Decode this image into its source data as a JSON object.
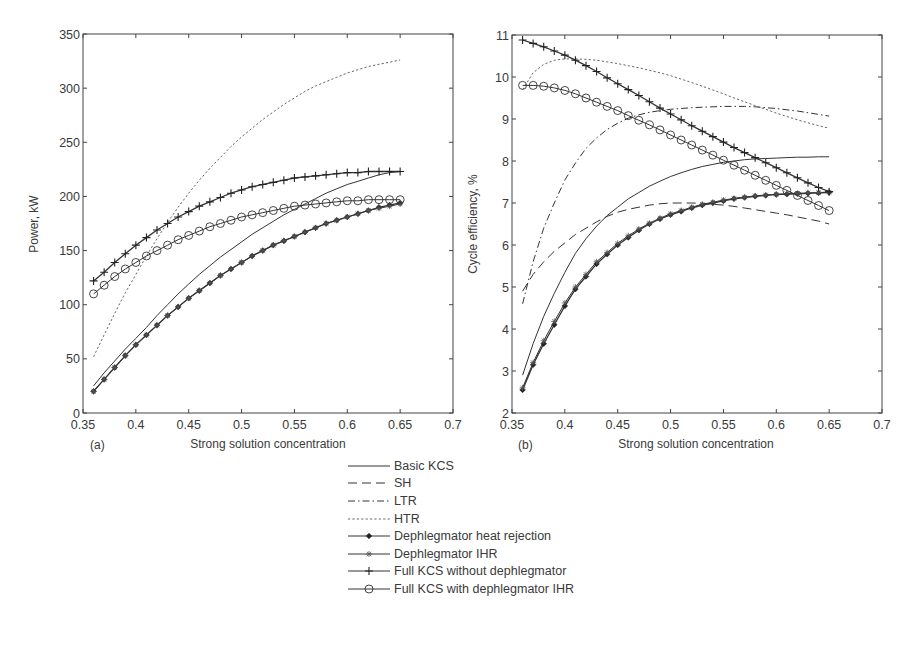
{
  "figure": {
    "panel_a_label": "(a)",
    "panel_b_label": "(b)"
  },
  "legend": {
    "items": [
      {
        "label": "Basic KCS",
        "style": "solid",
        "marker": "none"
      },
      {
        "label": "SH",
        "style": "longdash",
        "marker": "none"
      },
      {
        "label": "LTR",
        "style": "dashdot",
        "marker": "none"
      },
      {
        "label": "HTR",
        "style": "dotted",
        "marker": "none"
      },
      {
        "label": "Dephlegmator heat rejection",
        "style": "solid",
        "marker": "diamond"
      },
      {
        "label": "Dephlegmator IHR",
        "style": "solid",
        "marker": "star"
      },
      {
        "label": "Full KCS without dephlegmator",
        "style": "solid",
        "marker": "plus"
      },
      {
        "label": "Full KCS with dephlegmator IHR",
        "style": "solid",
        "marker": "circle"
      }
    ]
  },
  "chart_data": [
    {
      "type": "line",
      "panel": "(a)",
      "title": "",
      "xlabel": "Strong solution concentration",
      "ylabel": "Power, kW",
      "xlim": [
        0.35,
        0.7
      ],
      "ylim": [
        0,
        350
      ],
      "xticks": [
        "0.35",
        "0.4",
        "0.45",
        "0.5",
        "0.55",
        "0.6",
        "0.65",
        "0.7"
      ],
      "yticks": [
        "0",
        "50",
        "100",
        "150",
        "200",
        "250",
        "300",
        "350"
      ],
      "grid": false,
      "x": [
        0.36,
        0.37,
        0.38,
        0.39,
        0.4,
        0.41,
        0.42,
        0.43,
        0.44,
        0.45,
        0.46,
        0.47,
        0.48,
        0.49,
        0.5,
        0.51,
        0.52,
        0.53,
        0.54,
        0.55,
        0.56,
        0.57,
        0.58,
        0.59,
        0.6,
        0.61,
        0.62,
        0.63,
        0.64,
        0.65
      ],
      "series": [
        {
          "name": "Basic KCS",
          "values": [
            25,
            37,
            48,
            59,
            69,
            79,
            90,
            100,
            110,
            119,
            128,
            136,
            144,
            151,
            158,
            165,
            171,
            177,
            183,
            188,
            193,
            198,
            203,
            207,
            211,
            214,
            217,
            220,
            222,
            223
          ]
        },
        {
          "name": "HTR",
          "values": [
            52,
            72,
            92,
            111,
            128,
            145,
            161,
            176,
            190,
            203,
            215,
            226,
            236,
            246,
            255,
            263,
            271,
            278,
            285,
            291,
            297,
            302,
            306,
            310,
            314,
            317,
            320,
            322,
            324,
            326
          ]
        },
        {
          "name": "Dephlegmator heat rejection",
          "values": [
            20,
            31,
            42,
            53,
            63,
            72,
            81,
            90,
            98,
            106,
            113,
            120,
            127,
            133,
            139,
            145,
            150,
            155,
            159,
            163,
            167,
            171,
            175,
            178,
            181,
            184,
            187,
            190,
            192,
            194
          ]
        },
        {
          "name": "Dephlegmator IHR",
          "values": [
            20,
            31,
            42,
            53,
            63,
            72,
            81,
            90,
            98,
            106,
            113,
            120,
            127,
            133,
            139,
            145,
            150,
            155,
            159,
            163,
            167,
            171,
            175,
            178,
            181,
            184,
            187,
            189,
            191,
            193
          ]
        },
        {
          "name": "Full KCS without dephlegmator",
          "values": [
            122,
            130,
            139,
            147,
            155,
            162,
            169,
            175,
            181,
            186,
            191,
            195,
            199,
            203,
            206,
            209,
            211,
            213,
            215,
            217,
            218,
            219,
            220,
            221,
            222,
            222,
            223,
            223,
            223,
            223
          ]
        },
        {
          "name": "Full KCS with dephlegmator IHR",
          "values": [
            110,
            118,
            126,
            133,
            139,
            145,
            150,
            155,
            160,
            164,
            168,
            172,
            175,
            178,
            181,
            183,
            185,
            187,
            189,
            191,
            192,
            193,
            194,
            195,
            196,
            196,
            197,
            197,
            197,
            197
          ]
        }
      ]
    },
    {
      "type": "line",
      "panel": "(b)",
      "title": "",
      "xlabel": "Strong solution concentration",
      "ylabel": "Cycle efficiency, %",
      "xlim": [
        0.35,
        0.7
      ],
      "ylim": [
        2,
        11
      ],
      "xticks": [
        "0.35",
        "0.4",
        "0.45",
        "0.5",
        "0.55",
        "0.6",
        "0.65",
        "0.7"
      ],
      "yticks": [
        "2",
        "3",
        "4",
        "5",
        "6",
        "7",
        "8",
        "9",
        "10",
        "11"
      ],
      "grid": false,
      "x": [
        0.36,
        0.37,
        0.38,
        0.39,
        0.4,
        0.41,
        0.42,
        0.43,
        0.44,
        0.45,
        0.46,
        0.47,
        0.48,
        0.49,
        0.5,
        0.51,
        0.52,
        0.53,
        0.54,
        0.55,
        0.56,
        0.57,
        0.58,
        0.59,
        0.6,
        0.61,
        0.62,
        0.63,
        0.64,
        0.65
      ],
      "series": [
        {
          "name": "Basic KCS",
          "values": [
            2.9,
            3.65,
            4.3,
            4.85,
            5.35,
            5.8,
            6.15,
            6.45,
            6.7,
            6.9,
            7.1,
            7.25,
            7.4,
            7.52,
            7.63,
            7.72,
            7.8,
            7.87,
            7.92,
            7.97,
            8.0,
            8.03,
            8.05,
            8.06,
            8.07,
            8.08,
            8.09,
            8.09,
            8.1,
            8.1
          ]
        },
        {
          "name": "SH",
          "values": [
            4.9,
            5.3,
            5.6,
            5.85,
            6.05,
            6.25,
            6.4,
            6.55,
            6.68,
            6.78,
            6.85,
            6.9,
            6.95,
            6.98,
            7.0,
            7.0,
            7.0,
            6.99,
            6.97,
            6.95,
            6.92,
            6.88,
            6.84,
            6.8,
            6.76,
            6.72,
            6.67,
            6.62,
            6.57,
            6.5
          ]
        },
        {
          "name": "LTR",
          "values": [
            4.6,
            5.6,
            6.4,
            7.0,
            7.55,
            7.95,
            8.3,
            8.55,
            8.75,
            8.9,
            9.02,
            9.1,
            9.16,
            9.2,
            9.23,
            9.25,
            9.27,
            9.28,
            9.29,
            9.3,
            9.3,
            9.3,
            9.29,
            9.27,
            9.25,
            9.22,
            9.19,
            9.15,
            9.11,
            9.07
          ]
        },
        {
          "name": "HTR",
          "values": [
            9.7,
            10.1,
            10.3,
            10.4,
            10.43,
            10.43,
            10.42,
            10.4,
            10.36,
            10.32,
            10.27,
            10.22,
            10.16,
            10.1,
            10.03,
            9.95,
            9.87,
            9.78,
            9.69,
            9.6,
            9.5,
            9.41,
            9.32,
            9.23,
            9.14,
            9.06,
            8.98,
            8.91,
            8.84,
            8.78
          ]
        },
        {
          "name": "Dephlegmator heat rejection",
          "values": [
            2.55,
            3.15,
            3.65,
            4.1,
            4.55,
            4.95,
            5.25,
            5.55,
            5.78,
            6.0,
            6.18,
            6.35,
            6.5,
            6.62,
            6.72,
            6.8,
            6.88,
            6.95,
            7.0,
            7.05,
            7.1,
            7.13,
            7.16,
            7.18,
            7.2,
            7.21,
            7.22,
            7.23,
            7.24,
            7.25
          ]
        },
        {
          "name": "Dephlegmator IHR",
          "values": [
            2.6,
            3.2,
            3.72,
            4.18,
            4.62,
            5.0,
            5.3,
            5.6,
            5.82,
            6.04,
            6.22,
            6.38,
            6.52,
            6.64,
            6.74,
            6.82,
            6.9,
            6.97,
            7.02,
            7.07,
            7.11,
            7.14,
            7.17,
            7.19,
            7.21,
            7.22,
            7.23,
            7.24,
            7.25,
            7.26
          ]
        },
        {
          "name": "Full KCS without dephlegmator",
          "values": [
            10.88,
            10.8,
            10.72,
            10.62,
            10.52,
            10.4,
            10.27,
            10.13,
            9.98,
            9.84,
            9.7,
            9.56,
            9.41,
            9.26,
            9.12,
            8.98,
            8.84,
            8.71,
            8.58,
            8.45,
            8.32,
            8.2,
            8.08,
            7.96,
            7.84,
            7.72,
            7.6,
            7.48,
            7.37,
            7.27
          ]
        },
        {
          "name": "Full KCS with dephlegmator IHR",
          "values": [
            9.8,
            9.8,
            9.78,
            9.74,
            9.68,
            9.6,
            9.5,
            9.4,
            9.3,
            9.2,
            9.08,
            8.97,
            8.86,
            8.74,
            8.62,
            8.5,
            8.38,
            8.26,
            8.14,
            8.02,
            7.9,
            7.78,
            7.66,
            7.54,
            7.42,
            7.3,
            7.18,
            7.06,
            6.94,
            6.82
          ]
        }
      ]
    }
  ]
}
